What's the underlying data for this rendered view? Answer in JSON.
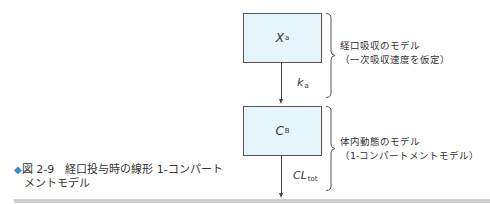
{
  "diagram": {
    "compartments": [
      {
        "symbol": "X",
        "subscript": "a"
      },
      {
        "symbol": "C",
        "subscript": "B"
      }
    ],
    "rates": [
      {
        "symbol": "k",
        "subscript": "a"
      },
      {
        "symbol": "CL",
        "subscript": "tot"
      }
    ],
    "groups": [
      {
        "line1": "経口吸収のモデル",
        "line2": "（一次吸収速度を仮定）"
      },
      {
        "line1": "体内動態のモデル",
        "line2": "（1-コンパートメントモデル）"
      }
    ]
  },
  "caption": {
    "marker": "◆",
    "line1": "図 2-9　経口投与時の線形 1-コンパート",
    "line2": "メントモデル"
  },
  "colors": {
    "box_fill": "#e6f4fb",
    "marker": "#2a8fd0",
    "footer_bar": "#cfcfcf"
  }
}
